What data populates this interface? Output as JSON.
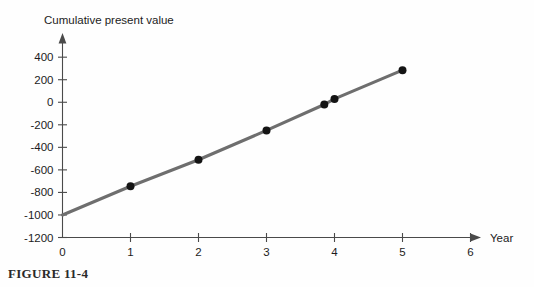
{
  "figure": {
    "caption": "FIGURE 11-4"
  },
  "chart_data": {
    "type": "line",
    "title": "Cumulative present value",
    "xlabel": "Year",
    "ylabel": "Cumulative present value",
    "xlim": [
      0,
      6.4
    ],
    "ylim": [
      -1200,
      520
    ],
    "grid": false,
    "legend": "none",
    "line_color": "#6e6e6e",
    "marker_color": "#141414",
    "axis_color": "#4a4a4a",
    "x_ticks": [
      0,
      1,
      2,
      3,
      4,
      5,
      6
    ],
    "x_tick_labels": [
      "0",
      "1",
      "2",
      "3",
      "4",
      "5",
      "6"
    ],
    "y_ticks": [
      -1200,
      -1000,
      -800,
      -600,
      -400,
      -200,
      0,
      200,
      400
    ],
    "y_tick_labels": [
      "-1200",
      "-1000",
      "-800",
      "-600",
      "-400",
      "-200",
      "0",
      "200",
      "400"
    ],
    "series": [
      {
        "name": "Cumulative present value",
        "x": [
          0,
          1,
          2,
          3,
          3.85,
          4,
          5
        ],
        "values": [
          -1000,
          -745,
          -510,
          -250,
          -20,
          30,
          285
        ],
        "markers": [
          false,
          true,
          true,
          true,
          true,
          true,
          true
        ]
      }
    ],
    "annotations": []
  }
}
